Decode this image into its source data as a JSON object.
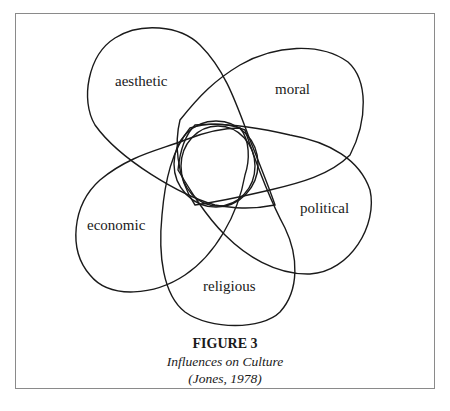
{
  "figure": {
    "title": "FIGURE 3",
    "subtitle": "Influences on Culture",
    "citation": "(Jones, 1978)"
  },
  "diagram": {
    "type": "overlapping-lobes",
    "center": "central circles (culture)",
    "lobes": [
      {
        "id": "aesthetic",
        "label": "aesthetic"
      },
      {
        "id": "moral",
        "label": "moral"
      },
      {
        "id": "political",
        "label": "political"
      },
      {
        "id": "religious",
        "label": "religious"
      },
      {
        "id": "economic",
        "label": "economic"
      }
    ]
  },
  "colors": {
    "stroke": "#1a1a1a",
    "frame": "#8a8a8a",
    "background": "#ffffff"
  }
}
